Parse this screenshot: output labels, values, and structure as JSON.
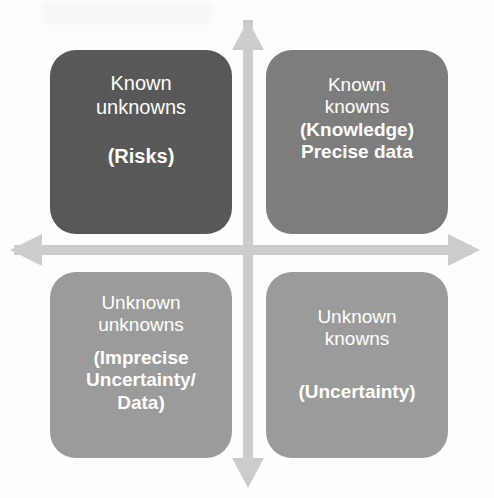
{
  "figure": {
    "type": "2x2-matrix-diagram",
    "background_color": "#fdfdfd",
    "text_color": "#ffffff",
    "axis_color": "#cccccc"
  },
  "axes": {
    "vertical_arrow_name": "vertical-double-arrow",
    "horizontal_arrow_name": "horizontal-double-arrow"
  },
  "quadrants": [
    {
      "id": "known-unknowns",
      "position": "top-left",
      "color": "#585858",
      "lines": [
        {
          "text": "Known",
          "weight": "regular"
        },
        {
          "text": "unknowns",
          "weight": "regular"
        },
        {
          "text": "(Risks)",
          "weight": "bold"
        }
      ]
    },
    {
      "id": "known-knowns",
      "position": "top-right",
      "color": "#7d7d7d",
      "lines": [
        {
          "text": "Known",
          "weight": "regular"
        },
        {
          "text": "knowns",
          "weight": "regular"
        },
        {
          "text": "(Knowledge)",
          "weight": "bold"
        },
        {
          "text": "Precise data",
          "weight": "bold"
        }
      ]
    },
    {
      "id": "unknown-unknowns",
      "position": "bottom-left",
      "color": "#9b9b9b",
      "lines": [
        {
          "text": "Unknown",
          "weight": "regular"
        },
        {
          "text": "unknowns",
          "weight": "regular"
        },
        {
          "text": "(Imprecise",
          "weight": "bold"
        },
        {
          "text": "Uncertainty/",
          "weight": "bold"
        },
        {
          "text": "Data)",
          "weight": "bold"
        }
      ]
    },
    {
      "id": "unknown-knowns",
      "position": "bottom-right",
      "color": "#9b9b9b",
      "lines": [
        {
          "text": "Unknown",
          "weight": "regular"
        },
        {
          "text": "knowns",
          "weight": "regular"
        },
        {
          "text": "(Uncertainty)",
          "weight": "bold"
        }
      ]
    }
  ]
}
